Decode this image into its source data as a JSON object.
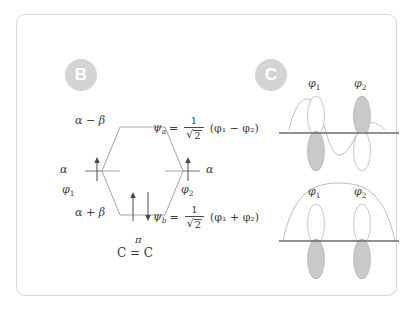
{
  "panels": {
    "b": {
      "badge": "B",
      "levels": {
        "antibonding_energy": "α − β",
        "bonding_energy": "α + β",
        "atomic_energy_left": "α",
        "atomic_energy_right": "α"
      },
      "orbital_left": "φ",
      "orbital_left_sub": "1",
      "orbital_right": "φ",
      "orbital_right_sub": "2",
      "psi_anti": {
        "symbol": "ψ",
        "sub": "a",
        "equals": "=",
        "numerator": "1",
        "radical": "√",
        "radicand": "2",
        "expression": "(φ₁ − φ₂)"
      },
      "psi_bond": {
        "symbol": "ψ",
        "sub": "b",
        "equals": "=",
        "numerator": "1",
        "radical": "√",
        "radicand": "2",
        "expression": "(φ₁ + φ₂)"
      },
      "system_symbol": "π",
      "system_label": "C = C",
      "electrons": {
        "left_atomic": "↑",
        "right_atomic": "↑",
        "bonding_pair": "↑↓"
      }
    },
    "c": {
      "badge": "C",
      "top": {
        "caption_left": "φ",
        "caption_left_sub": "1",
        "caption_right": "φ",
        "caption_right_sub": "2",
        "nodes": 1,
        "phase_relation": "out-of-phase"
      },
      "bottom": {
        "caption_left": "φ",
        "caption_left_sub": "1",
        "caption_right": "φ",
        "caption_right_sub": "2",
        "nodes": 0,
        "phase_relation": "in-phase"
      }
    }
  },
  "colors": {
    "card_border": "#d8d8d8",
    "badge_bg": "#d4d4d4",
    "badge_text": "#ffffff",
    "line": "#9a9a9a",
    "axis": "#6b6b6b",
    "lobe_fill": "#c9c9c9",
    "wave": "#bdbdbd",
    "text": "#3a3a3a",
    "background": "#ffffff"
  }
}
